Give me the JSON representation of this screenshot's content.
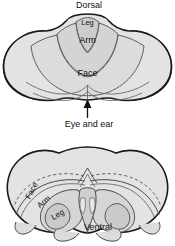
{
  "figure": {
    "panels": [
      {
        "id": "upper-panel",
        "name": "cerebellum-dorsal-view",
        "labels": {
          "dorsal": "Dorsal",
          "leg": "Leg",
          "arm": "Arm",
          "face": "Face"
        }
      },
      {
        "id": "annotation",
        "name": "eye-and-ear-callout",
        "labels": {
          "eye_and_ear": "Eye and ear"
        },
        "pointer": "arrow-up-icon"
      },
      {
        "id": "lower-panel",
        "name": "brain-cross-section",
        "labels": {
          "face": "Face",
          "arm": "Arm",
          "leg": "Leg",
          "ventral": "Ventral"
        }
      }
    ]
  },
  "colors": {
    "fill_light": "#e3e3e3",
    "fill_mid": "#d9d9d9",
    "fill_dark": "#cfcfcf",
    "outline": "#1a1a1a",
    "inner_line": "#6a6a6a",
    "dashed_line": "#555555",
    "text": "#111111",
    "background": "#ffffff"
  }
}
